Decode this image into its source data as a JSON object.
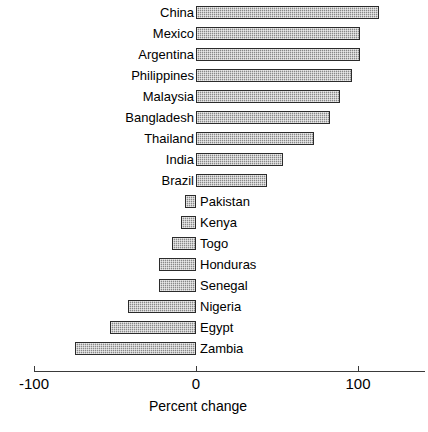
{
  "chart_data": {
    "type": "bar",
    "orientation": "horizontal",
    "title": "",
    "subtitle": "",
    "xlabel": "Percent change",
    "ylabel": "",
    "xlim": [
      -100,
      145
    ],
    "xticks": [
      -100,
      0,
      100
    ],
    "xtick_labels": [
      "-100",
      "0",
      "100"
    ],
    "grid": false,
    "legend": null,
    "series_name": "Percent change",
    "bar_color": "#aaaaaa",
    "bar_edge_color": "#2b2b2b",
    "axis_color": "#3a3a3a",
    "categories": [
      "China",
      "Mexico",
      "Argentina",
      "Philippines",
      "Malaysia",
      "Bangladesh",
      "Thailand",
      "India",
      "Brazil",
      "Pakistan",
      "Kenya",
      "Togo",
      "Honduras",
      "Senegal",
      "Nigeria",
      "Egypt",
      "Zambia"
    ],
    "values": [
      113,
      101,
      101,
      96,
      89,
      83,
      73,
      54,
      44,
      -7,
      -9,
      -15,
      -23,
      -23,
      -42,
      -53,
      -75
    ],
    "points": [
      {
        "category": "China",
        "value": 113,
        "label_side": "left"
      },
      {
        "category": "Mexico",
        "value": 101,
        "label_side": "left"
      },
      {
        "category": "Argentina",
        "value": 101,
        "label_side": "left"
      },
      {
        "category": "Philippines",
        "value": 96,
        "label_side": "left"
      },
      {
        "category": "Malaysia",
        "value": 89,
        "label_side": "left"
      },
      {
        "category": "Bangladesh",
        "value": 83,
        "label_side": "left"
      },
      {
        "category": "Thailand",
        "value": 73,
        "label_side": "left"
      },
      {
        "category": "India",
        "value": 54,
        "label_side": "left"
      },
      {
        "category": "Brazil",
        "value": 44,
        "label_side": "left"
      },
      {
        "category": "Pakistan",
        "value": -7,
        "label_side": "right"
      },
      {
        "category": "Kenya",
        "value": -9,
        "label_side": "right"
      },
      {
        "category": "Togo",
        "value": -15,
        "label_side": "right"
      },
      {
        "category": "Honduras",
        "value": -23,
        "label_side": "right"
      },
      {
        "category": "Senegal",
        "value": -23,
        "label_side": "right"
      },
      {
        "category": "Nigeria",
        "value": -42,
        "label_side": "right"
      },
      {
        "category": "Egypt",
        "value": -53,
        "label_side": "right"
      },
      {
        "category": "Zambia",
        "value": -75,
        "label_side": "right"
      }
    ]
  }
}
